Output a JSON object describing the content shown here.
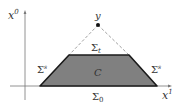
{
  "diagram": {
    "axes": {
      "vertical_label": "x",
      "vertical_sup": "0",
      "horizontal_label": "x",
      "horizontal_sup": "1"
    },
    "apex": {
      "label": "y"
    },
    "region": {
      "label": "C",
      "fill": "#808080",
      "edge": "#1a1a1a"
    },
    "boundaries": {
      "top": {
        "base": "Σ",
        "sub": "t"
      },
      "bottom": {
        "base": "Σ",
        "sub": "0"
      },
      "left_side": {
        "base": "Σ",
        "sup": "s"
      },
      "right_side": {
        "base": "Σ",
        "sup": "s"
      }
    },
    "colors": {
      "axis": "#666666",
      "dashed": "#888888",
      "text": "#333333"
    }
  }
}
